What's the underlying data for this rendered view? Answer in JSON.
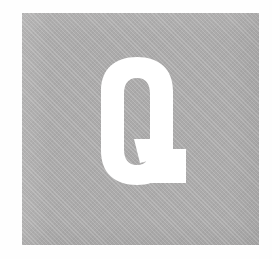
{
  "page": {
    "background_color": "#fefefe",
    "width": 272,
    "height": 259
  },
  "tile": {
    "name": "letter-tile",
    "background_color": "#abaaaa",
    "left": 22,
    "top": 13,
    "width": 237,
    "height": 232
  },
  "glyph": {
    "character": "Q",
    "color": "#ffffff",
    "style": "bold condensed serif",
    "alt_text": "Q"
  }
}
